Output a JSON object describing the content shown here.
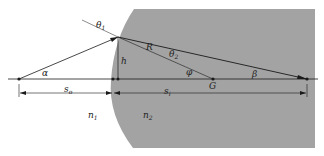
{
  "diagram": {
    "colors": {
      "background": "#ffffff",
      "medium2": "#a3a3a3",
      "lines": "#1a1a1a"
    },
    "labels": {
      "theta1": "θ",
      "theta1_sub": "1",
      "theta2": "θ",
      "theta2_sub": "2",
      "alpha": "α",
      "beta": "β",
      "phi": "φ",
      "R": "R",
      "h": "h",
      "G": "G",
      "so": "s",
      "so_sub": "o",
      "si": "s",
      "si_sub": "i",
      "n1": "n",
      "n1_sub": "1",
      "n2": "n",
      "n2_sub": "2"
    }
  }
}
